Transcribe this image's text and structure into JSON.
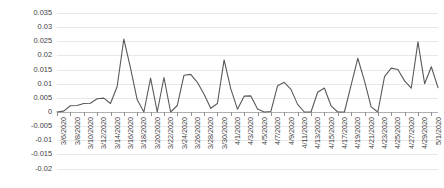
{
  "chart_data": {
    "type": "line",
    "title": "",
    "subtitle": "",
    "xlabel": "",
    "ylabel": "",
    "grid": true,
    "legend": false,
    "legend_position": "none",
    "line_color": "#595959",
    "gridline_color": "#e8e8e8",
    "ylim": [
      -0.02,
      0.035
    ],
    "ytick_step": 0.005,
    "ytick_labels": [
      "0.035",
      "0.03",
      "0.025",
      "0.02",
      "0.015",
      "0.01",
      "0.005",
      "0",
      "-0.005",
      "-0.01",
      "-0.015",
      "-0.02"
    ],
    "ytick_values": [
      0.035,
      0.03,
      0.025,
      0.02,
      0.015,
      0.01,
      0.005,
      0,
      -0.005,
      -0.01,
      -0.015,
      -0.02
    ],
    "xtick_labels": [
      "3/6/2020",
      "3/8/2020",
      "3/10/2020",
      "3/12/2020",
      "3/14/2020",
      "3/16/2020",
      "3/18/2020",
      "3/20/2020",
      "3/22/2020",
      "3/24/2020",
      "3/26/2020",
      "3/28/2020",
      "3/30/2020",
      "4/1/2020",
      "4/3/2020",
      "4/5/2020",
      "4/7/2020",
      "4/9/2020",
      "4/11/2020",
      "4/13/2020",
      "4/15/2020",
      "4/17/2020",
      "4/19/2020",
      "4/21/2020",
      "4/23/2020",
      "4/25/2020",
      "4/27/2020",
      "4/29/2020",
      "5/1/2020"
    ],
    "x": [
      "3/6/2020",
      "3/7/2020",
      "3/8/2020",
      "3/9/2020",
      "3/10/2020",
      "3/11/2020",
      "3/12/2020",
      "3/13/2020",
      "3/14/2020",
      "3/15/2020",
      "3/16/2020",
      "3/17/2020",
      "3/18/2020",
      "3/19/2020",
      "3/20/2020",
      "3/21/2020",
      "3/22/2020",
      "3/23/2020",
      "3/24/2020",
      "3/25/2020",
      "3/26/2020",
      "3/27/2020",
      "3/28/2020",
      "3/29/2020",
      "3/30/2020",
      "3/31/2020",
      "4/1/2020",
      "4/2/2020",
      "4/3/2020",
      "4/4/2020",
      "4/5/2020",
      "4/6/2020",
      "4/7/2020",
      "4/8/2020",
      "4/9/2020",
      "4/10/2020",
      "4/11/2020",
      "4/12/2020",
      "4/13/2020",
      "4/14/2020",
      "4/15/2020",
      "4/16/2020",
      "4/17/2020",
      "4/18/2020",
      "4/19/2020",
      "4/20/2020",
      "4/21/2020",
      "4/22/2020",
      "4/23/2020",
      "4/24/2020",
      "4/25/2020",
      "4/26/2020",
      "4/27/2020",
      "4/28/2020",
      "4/29/2020",
      "4/30/2020",
      "5/1/2020",
      "5/2/2020"
    ],
    "values": [
      0.0,
      0.0003,
      0.0022,
      0.0023,
      0.003,
      0.0031,
      0.0047,
      0.0049,
      0.003,
      0.009,
      0.0258,
      0.0155,
      0.0043,
      0.0,
      0.012,
      0.0,
      0.0122,
      0.0,
      0.0023,
      0.013,
      0.0133,
      0.0105,
      0.0063,
      0.0013,
      0.003,
      0.0184,
      0.0082,
      0.001,
      0.0056,
      0.0057,
      0.0011,
      0.0,
      0.0002,
      0.0093,
      0.0105,
      0.008,
      0.0027,
      0.0,
      0.0,
      0.007,
      0.0085,
      0.0022,
      0.0,
      0.0,
      0.0095,
      0.019,
      0.011,
      0.0018,
      0.0,
      0.0125,
      0.0155,
      0.015,
      0.011,
      0.0084,
      0.0248,
      0.01,
      0.016,
      0.0086
    ]
  }
}
